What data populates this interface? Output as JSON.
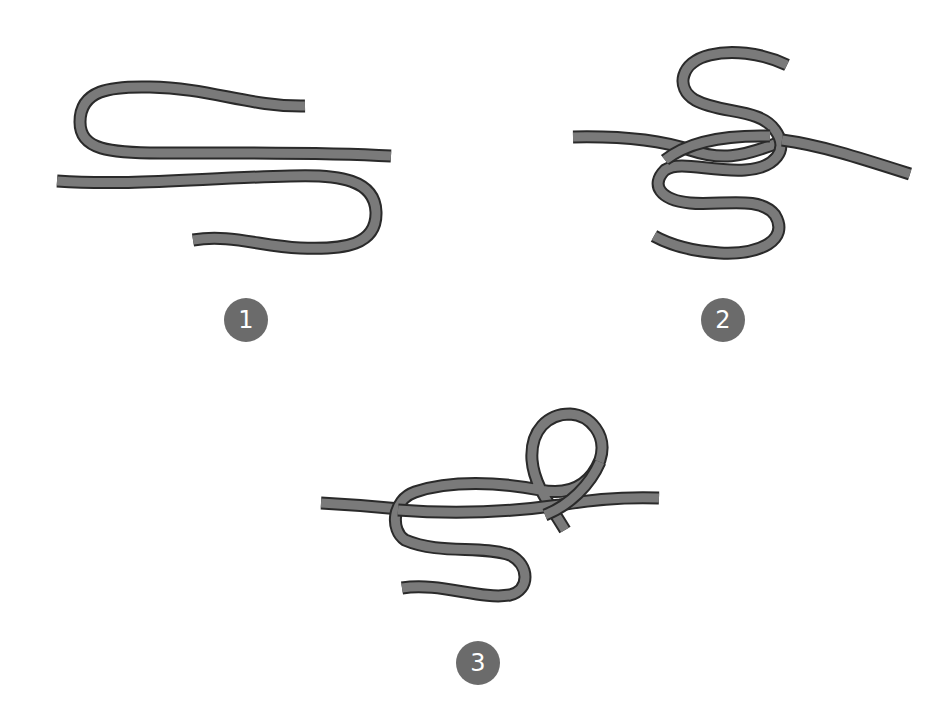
{
  "diagram": {
    "colors": {
      "background": "#ffffff",
      "rope_fill": "#7a7a7a",
      "rope_outline": "#2a2a2a",
      "badge_fill": "#6b6b6b",
      "badge_text": "#ffffff"
    },
    "steps": [
      {
        "number": "1",
        "description": "Two rope ends laid parallel, each folded back into a U-bend"
      },
      {
        "number": "2",
        "description": "Working end wrapped in an S-shape crossing the standing line"
      },
      {
        "number": "3",
        "description": "Working end looped over and tucked, forming the knot"
      }
    ]
  }
}
